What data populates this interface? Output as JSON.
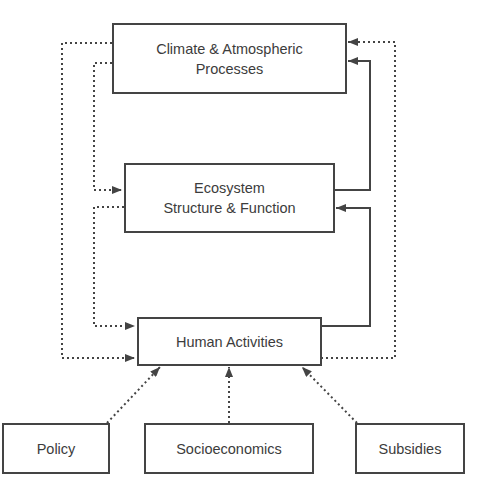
{
  "diagram": {
    "type": "flow-diagram",
    "nodes": {
      "climate": {
        "line1": "Climate & Atmospheric",
        "line2": "Processes"
      },
      "ecosystem": {
        "line1": "Ecosystem",
        "line2": "Structure & Function"
      },
      "human": {
        "label": "Human Activities"
      },
      "policy": {
        "label": "Policy"
      },
      "socioeconomics": {
        "label": "Socioeconomics"
      },
      "subsidies": {
        "label": "Subsidies"
      }
    },
    "edges": [
      {
        "from": "human",
        "to": "climate",
        "style": "dotted"
      },
      {
        "from": "ecosystem",
        "to": "climate",
        "style": "solid"
      },
      {
        "from": "climate",
        "to": "ecosystem",
        "style": "dotted"
      },
      {
        "from": "human",
        "to": "ecosystem",
        "style": "solid"
      },
      {
        "from": "ecosystem",
        "to": "human",
        "style": "dotted"
      },
      {
        "from": "climate",
        "to": "human",
        "style": "dotted"
      },
      {
        "from": "policy",
        "to": "human",
        "style": "dotted"
      },
      {
        "from": "socioeconomics",
        "to": "human",
        "style": "dotted"
      },
      {
        "from": "subsidies",
        "to": "human",
        "style": "dotted"
      }
    ],
    "colors": {
      "stroke": "#444444",
      "text": "#3c3c3c",
      "background": "#ffffff"
    }
  }
}
